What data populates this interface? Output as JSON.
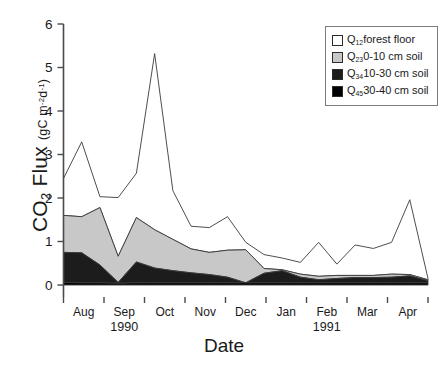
{
  "chart_data": {
    "type": "area",
    "title": "",
    "subtitle": "",
    "xlabel": "Date",
    "ylabel": "CO2 Flux",
    "ylabel_units": "(gC m-2d-1)",
    "stacked": true,
    "grid": false,
    "legend_position": "top-right",
    "ylim": [
      0,
      6
    ],
    "yticks": [
      0,
      1,
      2,
      3,
      4,
      5,
      6
    ],
    "ytick_labels": [
      "0",
      "1",
      "2",
      "3",
      "4",
      "5",
      "6"
    ],
    "xtick_labels": [
      "Aug",
      "Sep",
      "Oct",
      "Nov",
      "Dec",
      "Jan",
      "Feb",
      "Mar",
      "Apr"
    ],
    "xlim_years": [
      "1990",
      "1991"
    ],
    "year_labels": [
      {
        "text": "1990",
        "x_month": "Sep"
      },
      {
        "text": "1991",
        "x_month": "Feb"
      }
    ],
    "x": [
      "Jul-15-1990",
      "Aug-01-1990",
      "Aug-15-1990",
      "Aug-25-1990",
      "Sep-05-1990",
      "Sep-15-1990",
      "Sep-25-1990",
      "Oct-10-1990",
      "Oct-25-1990",
      "Nov-10-1990",
      "Nov-25-1990",
      "Dec-10-1990",
      "Dec-25-1990",
      "Jan-10-1991",
      "Jan-25-1991",
      "Feb-10-1991",
      "Feb-25-1991",
      "Mar-10-1991",
      "Mar-25-1991",
      "Apr-10-1991",
      "Apr-25-1991"
    ],
    "series": [
      {
        "name": "Q45 30-40 cm soil",
        "label": "Q4530-40 cm soil",
        "color": "#000000",
        "values": [
          0.06,
          0.05,
          0.05,
          0.04,
          0.05,
          0.05,
          0.05,
          0.05,
          0.05,
          0.05,
          0.05,
          0.05,
          0.05,
          0.05,
          0.05,
          0.05,
          0.05,
          0.05,
          0.05,
          0.05,
          0.05
        ]
      },
      {
        "name": "Q34 10-30 cm soil",
        "label": "Q3410-30 cm soil",
        "color": "#1c1c1c",
        "values": [
          0.69,
          0.69,
          0.41,
          0.02,
          0.48,
          0.34,
          0.28,
          0.23,
          0.19,
          0.13,
          0.0,
          0.22,
          0.28,
          0.13,
          0.07,
          0.1,
          0.12,
          0.12,
          0.13,
          0.16,
          0.05
        ]
      },
      {
        "name": "Q23 0-10 cm soil",
        "label": "Q230-10 cm soil",
        "color": "#c8c8c8",
        "values": [
          0.85,
          0.83,
          1.32,
          0.6,
          1.02,
          0.88,
          0.72,
          0.55,
          0.51,
          0.62,
          0.76,
          0.11,
          0.02,
          0.07,
          0.08,
          0.07,
          0.05,
          0.05,
          0.07,
          0.03,
          0.02
        ]
      },
      {
        "name": "Q12 forest floor",
        "label": "Q12forest floor",
        "color": "#ffffff",
        "values": [
          0.85,
          1.72,
          0.25,
          1.35,
          1.02,
          4.05,
          1.12,
          0.52,
          0.57,
          0.77,
          0.17,
          0.32,
          0.27,
          0.27,
          0.78,
          0.26,
          0.7,
          0.62,
          0.73,
          1.72,
          0.03
        ]
      }
    ],
    "stacked_totals": [
      2.45,
      3.29,
      2.03,
      2.01,
      2.57,
      5.32,
      2.17,
      1.35,
      1.32,
      1.57,
      0.98,
      0.7,
      0.62,
      0.52,
      0.98,
      0.48,
      0.92,
      0.84,
      0.98,
      1.96,
      0.15
    ],
    "peaks": [
      {
        "label": "September peak",
        "value": 5.3
      },
      {
        "label": "August peak",
        "value": 3.3
      }
    ]
  },
  "legend": {
    "items": [
      {
        "label_prefix": "Q",
        "sub": "12",
        "label": "forest floor",
        "color": "#ffffff"
      },
      {
        "label_prefix": "Q",
        "sub": "23",
        "label": "0-10 cm soil",
        "color": "#c8c8c8"
      },
      {
        "label_prefix": "Q",
        "sub": "34",
        "label": "10-30 cm soil",
        "color": "#1c1c1c"
      },
      {
        "label_prefix": "Q",
        "sub": "45",
        "label": "30-40 cm soil",
        "color": "#000000"
      }
    ]
  },
  "axes": {
    "y_title_main": "CO",
    "y_title_sub": "2",
    "y_title_rest": " Flux",
    "y_units_a": "(gC m",
    "y_units_sup1": "-2",
    "y_units_b": "d",
    "y_units_sup2": "-1",
    "y_units_c": ")",
    "x_title": "Date"
  }
}
